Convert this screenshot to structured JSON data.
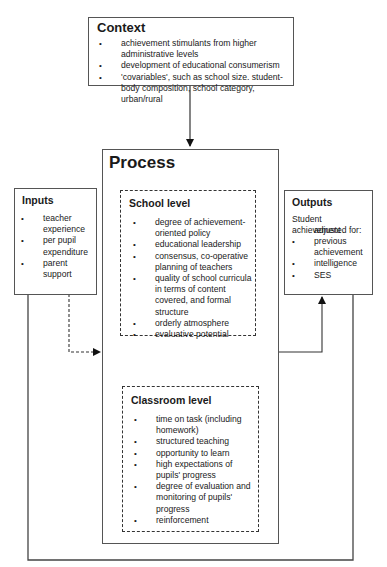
{
  "context": {
    "title": "Context",
    "items": [
      "achievement stimulants from higher administrative levels",
      "development of educational consumerism",
      "'covariables', such as school size. student-body composition, school category, urban/rural"
    ]
  },
  "process": {
    "title": "Process",
    "school_level": {
      "title": "School level",
      "items": [
        "degree of achievement-oriented policy",
        "educational leadership",
        "consensus, co-operative planning of teachers",
        "quality of school curricula in terms of content covered, and formal structure",
        "orderly atmosphere",
        "evaluative potential"
      ]
    },
    "classroom_level": {
      "title": "Classroom level",
      "items": [
        "time on task (including homework)",
        "structured teaching",
        "opportunity to learn",
        "high expectations of pupils' progress",
        "degree of evaluation and monitoring of pupils' progress",
        "reinforcement"
      ]
    }
  },
  "inputs": {
    "title": "Inputs",
    "items": [
      "teacher experience",
      "per pupil expenditure",
      "parent support"
    ]
  },
  "outputs": {
    "title": "Outputs",
    "intro": "Student achievement",
    "intro2": "adjusted for:",
    "items": [
      "previous achievement",
      "intelligence",
      "SES"
    ]
  },
  "colors": {
    "line": "#333333",
    "box_border": "#555555",
    "arrow_fill": "#000000"
  }
}
